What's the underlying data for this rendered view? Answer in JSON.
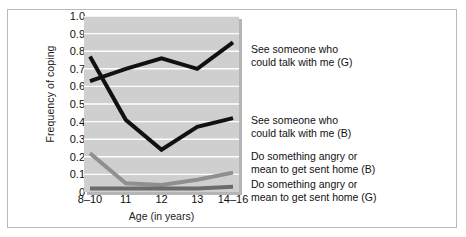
{
  "figure": {
    "xlabel": "Age (in years)",
    "ylabel": "Frequency of coping"
  },
  "chart_data": {
    "type": "line",
    "title": "",
    "xlabel": "Age (in years)",
    "ylabel": "Frequency of coping",
    "categories": [
      "8–10",
      "11",
      "12",
      "13",
      "14–16"
    ],
    "ylim": [
      0,
      1.0
    ],
    "ytick_labels": [
      "0",
      "0.1",
      "0.2",
      "0.3",
      "0.4",
      "0.5",
      "0.6",
      "0.7",
      "0.8",
      "0.9",
      "1.0"
    ],
    "ytick_values": [
      0,
      0.1,
      0.2,
      0.3,
      0.4,
      0.5,
      0.6,
      0.7,
      0.8,
      0.9,
      1.0
    ],
    "grid": "horizontal white gridlines on gray panel",
    "legend_position": "right of plot, inline series labels",
    "plot_background": "#cfcfcf",
    "gridline_color": "#ffffff",
    "series": [
      {
        "name": "See someone who could talk with me (G)",
        "label_line1": "See someone who",
        "label_line2": "could talk with me (G)",
        "color": "#111111",
        "width": 4,
        "values": [
          0.63,
          0.7,
          0.76,
          0.7,
          0.85
        ]
      },
      {
        "name": "See someone who could talk with me (B)",
        "label_line1": "See someone who",
        "label_line2": "could talk with me (B)",
        "color": "#111111",
        "width": 4,
        "values": [
          0.77,
          0.41,
          0.24,
          0.37,
          0.42
        ]
      },
      {
        "name": "Do something angry or mean to get sent home (B)",
        "label_line1": "Do something angry or",
        "label_line2": "mean to get sent home (B)",
        "color": "#8f8f8f",
        "width": 4,
        "values": [
          0.22,
          0.05,
          0.04,
          0.07,
          0.11
        ]
      },
      {
        "name": "Do something angry or mean to get sent home (G)",
        "label_line1": "Do something angry or",
        "label_line2": "mean to get sent home (G)",
        "color": "#6b6b6b",
        "width": 4,
        "values": [
          0.02,
          0.02,
          0.02,
          0.02,
          0.03
        ]
      }
    ]
  }
}
